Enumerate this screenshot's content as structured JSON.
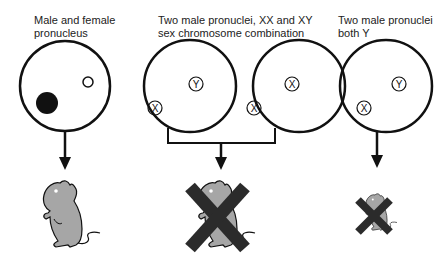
{
  "panels": [
    {
      "title_line1": "Male and female",
      "title_line2": "pronucleus",
      "outcome": "viable"
    },
    {
      "title_line1": "Two male pronuclei, XX and XY",
      "title_line2": "sex chromosome combination",
      "outcome": "not viable"
    },
    {
      "title_line1": "Two male pronuclei",
      "title_line2": "both Y",
      "outcome": "not viable"
    }
  ],
  "chromosomes": {
    "x": "X",
    "y": "Y"
  },
  "colors": {
    "stroke": "#111111",
    "mouse": "#a6a6a6",
    "cross": "#2b2b2b",
    "female_pronucleus": "#111111"
  }
}
